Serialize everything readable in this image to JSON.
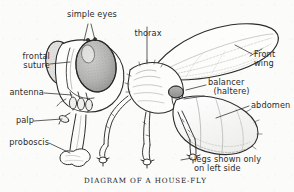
{
  "figure": {
    "title": "DIAGRAM OF A HOUSE-FLY",
    "subject": "house-fly",
    "style": "vintage pen-and-ink scientific line drawing, left-facing lateral view",
    "background_color": "#fbfbfa",
    "ink_color": "#2b2b2b",
    "caption": "DIAGRAM OF A HOUSE-FLY",
    "note": "legs shown only\non left side"
  },
  "labels": {
    "simple_eyes": "simple eyes",
    "thorax": "thorax",
    "front_wing": "Front\nwing",
    "balancer": "balancer\n  (haltere)",
    "abdomen": "abdomen",
    "frontal_suture": "frontal\nsuture",
    "antenna": "antenna",
    "palp": "palp",
    "proboscis": "proboscis",
    "legs_note": "legs shown only\non left side"
  },
  "parts": [
    {
      "name": "simple eyes",
      "position": "top of head",
      "label": "simple eyes"
    },
    {
      "name": "compound eye",
      "position": "side of head",
      "label": ""
    },
    {
      "name": "frontal suture",
      "position": "front of head",
      "label": "frontal suture"
    },
    {
      "name": "antenna",
      "position": "lower front of head",
      "label": "antenna"
    },
    {
      "name": "palp",
      "position": "below antenna",
      "label": "palp"
    },
    {
      "name": "proboscis",
      "position": "underside of head",
      "label": "proboscis"
    },
    {
      "name": "thorax",
      "position": "mid body",
      "label": "thorax"
    },
    {
      "name": "front wing",
      "position": "upper right, large",
      "label": "Front wing"
    },
    {
      "name": "balancer",
      "position": "behind thorax",
      "label": "balancer (haltere)"
    },
    {
      "name": "abdomen",
      "position": "rear body",
      "label": "abdomen"
    },
    {
      "name": "legs",
      "position": "three pairs, left side",
      "label": "legs shown only on left side"
    }
  ]
}
